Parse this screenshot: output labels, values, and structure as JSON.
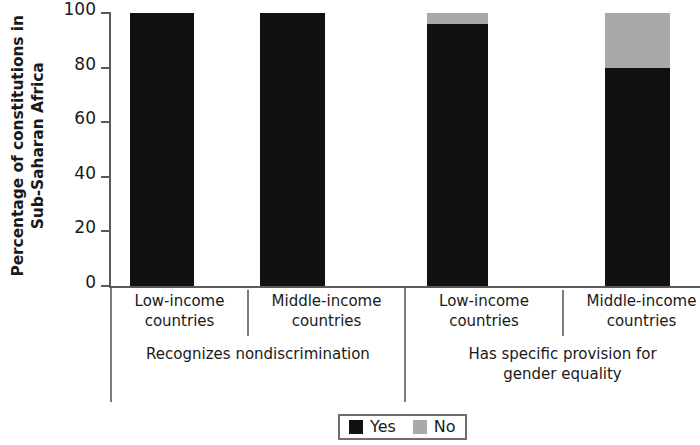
{
  "chart_data": {
    "type": "bar",
    "stacked": true,
    "title": "",
    "xlabel": "",
    "ylabel": "Percentage of constitutions in Sub-Saharan Africa",
    "ylabel_lines": [
      "Percentage of constitutions in",
      "Sub-Saharan Africa"
    ],
    "ylim": [
      0,
      100
    ],
    "yticks": [
      0,
      20,
      40,
      60,
      80,
      100
    ],
    "ytick_labels": [
      "0",
      "20",
      "40",
      "60",
      "80",
      "100"
    ],
    "grid": false,
    "legend_position": "bottom-center",
    "categories": [
      "Low-income countries",
      "Middle-income countries",
      "Low-income countries",
      "Middle-income countries"
    ],
    "groups": [
      {
        "label": "Recognizes nondiscrimination",
        "label_lines": [
          "Recognizes nondiscrimination"
        ],
        "categories": [
          "Low-income countries",
          "Middle-income countries"
        ]
      },
      {
        "label": "Has specific provision for gender equality",
        "label_lines": [
          "Has specific provision for",
          "gender equality"
        ],
        "categories": [
          "Low-income countries",
          "Middle-income countries"
        ]
      }
    ],
    "series": [
      {
        "name": "Yes",
        "color": "#111111",
        "values": [
          100,
          100,
          96,
          80
        ]
      },
      {
        "name": "No",
        "color": "#a9a9a9",
        "values": [
          0,
          0,
          4,
          20
        ]
      }
    ],
    "bars": [
      {
        "group": "Recognizes nondiscrimination",
        "category_lines": [
          "Low-income",
          "countries"
        ],
        "yes": 100,
        "no": 0
      },
      {
        "group": "Recognizes nondiscrimination",
        "category_lines": [
          "Middle-income",
          "countries"
        ],
        "yes": 100,
        "no": 0
      },
      {
        "group": "Has specific provision for gender equality",
        "category_lines": [
          "Low-income",
          "countries"
        ],
        "yes": 96,
        "no": 4
      },
      {
        "group": "Has specific provision for gender equality",
        "category_lines": [
          "Middle-income",
          "countries"
        ],
        "yes": 80,
        "no": 20
      }
    ]
  },
  "legend": {
    "items": [
      {
        "label": "Yes",
        "swatch": "yes"
      },
      {
        "label": "No",
        "swatch": "no"
      }
    ]
  },
  "axis": {
    "tick_labels": [
      "100",
      "80",
      "60",
      "40",
      "20",
      "0"
    ]
  },
  "cat_labels": {
    "b0_l1": "Low-income",
    "b0_l2": "countries",
    "b1_l1": "Middle-income",
    "b1_l2": "countries",
    "b2_l1": "Low-income",
    "b2_l2": "countries",
    "b3_l1": "Middle-income",
    "b3_l2": "countries"
  },
  "group_labels": {
    "g0_l1": "Recognizes nondiscrimination",
    "g0_l2": "",
    "g1_l1": "Has specific provision for",
    "g1_l2": "gender equality"
  }
}
